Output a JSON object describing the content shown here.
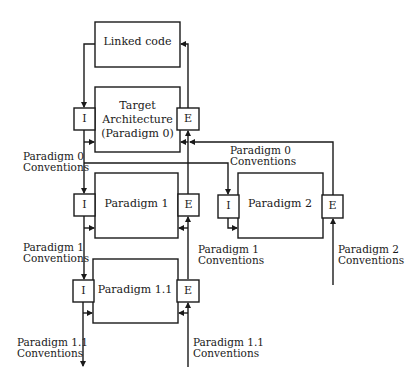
{
  "diagram": {
    "nodes": [
      {
        "id": "linked",
        "label": "Linked code"
      },
      {
        "id": "target",
        "label_lines": [
          "Target",
          "Architecture",
          "(Paradigm 0)"
        ]
      },
      {
        "id": "p1",
        "label": "Paradigm 1"
      },
      {
        "id": "p2",
        "label": "Paradigm 2"
      },
      {
        "id": "p11",
        "label": "Paradigm 1.1"
      }
    ],
    "ports": {
      "import": "I",
      "export": "E"
    },
    "conventions": [
      {
        "id": "c0_left",
        "line1": "Paradigm 0",
        "line2": "Conventions"
      },
      {
        "id": "c0_right",
        "line1": "Paradigm 0",
        "line2": "Conventions"
      },
      {
        "id": "c1_left",
        "line1": "Paradigm 1",
        "line2": "Conventions"
      },
      {
        "id": "c1_right",
        "line1": "Paradigm 1",
        "line2": "Conventions"
      },
      {
        "id": "c2",
        "line1": "Paradigm 2",
        "line2": "Conventions"
      },
      {
        "id": "c11_left",
        "line1": "Paradigm 1.1",
        "line2": "Conventions"
      },
      {
        "id": "c11_right",
        "line1": "Paradigm 1.1",
        "line2": "Conventions"
      }
    ],
    "edges": [
      {
        "from": "linked",
        "to": "target.I"
      },
      {
        "from": "target.E",
        "to": "linked"
      },
      {
        "from": "target.I",
        "to": "p1.I"
      },
      {
        "from": "p1.I",
        "to": "p11.I"
      },
      {
        "from": "p11.I",
        "to": "out_p11_conventions"
      },
      {
        "from": "in_p11_conventions",
        "to": "p11.E"
      },
      {
        "from": "p11.E",
        "to": "p1.E"
      },
      {
        "from": "p1.E",
        "to": "target.E"
      },
      {
        "from": "p2.E",
        "to": "target.E"
      },
      {
        "from": "in_p2_conventions",
        "to": "p2.E"
      },
      {
        "from": "target.I",
        "to": "p2.I"
      }
    ]
  }
}
